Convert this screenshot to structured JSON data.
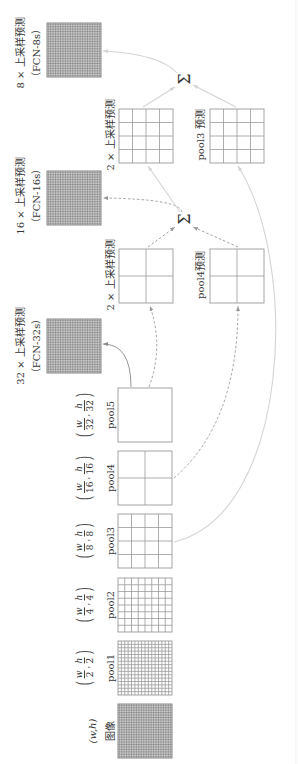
{
  "figure": {
    "input": {
      "label": "图像",
      "size": "(w,h)",
      "cells": 32
    },
    "pools": [
      {
        "label": "pool1",
        "size": {
          "num_w": "w",
          "den_w": "2",
          "num_h": "h",
          "den_h": "2"
        },
        "cells": 16
      },
      {
        "label": "pool2",
        "size": {
          "num_w": "w",
          "den_w": "4",
          "num_h": "h",
          "den_h": "4"
        },
        "cells": 8
      },
      {
        "label": "pool3",
        "size": {
          "num_w": "w",
          "den_w": "8",
          "num_h": "h",
          "den_h": "8"
        },
        "cells": 4
      },
      {
        "label": "pool4",
        "size": {
          "num_w": "w",
          "den_w": "16",
          "num_h": "h",
          "den_h": "16"
        },
        "cells": 2
      },
      {
        "label": "pool5",
        "size": {
          "num_w": "w",
          "den_w": "32",
          "num_h": "h",
          "den_h": "32"
        },
        "cells": 1
      }
    ],
    "size_glyphs": {
      "open": "(",
      "close": ")",
      "sep": ","
    },
    "predictions": {
      "up2_from_pool5": {
        "label": "2 × 上采样预测",
        "cells": 2
      },
      "pool4_pred": {
        "label": "pool4预测",
        "cells": 2
      },
      "up2_from_sum": {
        "label": "2 × 上采样预测",
        "cells": 4
      },
      "pool3_pred": {
        "label": "pool3 预测",
        "cells": 4
      }
    },
    "outputs": [
      {
        "title": "32 × 上采样预测",
        "subtitle": "（FCN-32s）",
        "cells": 32
      },
      {
        "title": "16 × 上采样预测",
        "subtitle": "（FCN-16s）",
        "cells": 32
      },
      {
        "title": "8 × 上采样预测",
        "subtitle": "（FCN-8s）",
        "cells": 32
      }
    ],
    "sum_symbol": "Σ",
    "colors": {
      "text": "#333333",
      "grid": "#9a9a9a",
      "dense_grid": "#7a7a7a",
      "solid_arrow": "#8a8a8a",
      "dashed_arrow": "#9a9a9a",
      "light_arrow": "#d4d4d4"
    }
  }
}
